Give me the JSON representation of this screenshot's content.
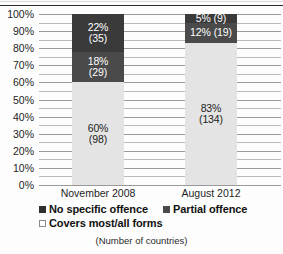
{
  "caption": "(Number of countries)",
  "legend": {
    "items": [
      {
        "label": "No specific offence",
        "color": "#2f2f2f"
      },
      {
        "label": "Partial offence",
        "color": "#4a4a4a"
      },
      {
        "label": "Covers most/all forms",
        "color": "#ffffff"
      }
    ]
  },
  "chart_data": {
    "type": "bar",
    "stacked": true,
    "title": "",
    "subtitle": "",
    "xlabel": "",
    "ylabel": "",
    "ylim": [
      0,
      100
    ],
    "y_tick_labels": [
      "100%",
      "90%",
      "80%",
      "70%",
      "60%",
      "50%",
      "40%",
      "30%",
      "20%",
      "10%",
      "0%"
    ],
    "y_tick_values": [
      100,
      90,
      80,
      70,
      60,
      50,
      40,
      30,
      20,
      10,
      0
    ],
    "gridline_interval": 5,
    "grid": true,
    "legend_position": "bottom",
    "categories": [
      "November 2008",
      "August 2012"
    ],
    "series": [
      {
        "name": "No specific offence",
        "color": "#3a3a3a",
        "values": [
          22,
          5
        ],
        "counts": [
          35,
          9
        ],
        "labels": [
          "22%\n(35)",
          "5% (9)"
        ]
      },
      {
        "name": "Partial offence",
        "color": "#4a4a4a",
        "values": [
          18,
          12
        ],
        "counts": [
          29,
          19
        ],
        "labels": [
          "18%\n(29)",
          "12% (19)"
        ]
      },
      {
        "name": "Covers most/all forms",
        "color": "#e4e4e4",
        "values": [
          60,
          83
        ],
        "counts": [
          98,
          134
        ],
        "labels": [
          "60%\n(98)",
          "83%\n(134)"
        ]
      }
    ]
  }
}
